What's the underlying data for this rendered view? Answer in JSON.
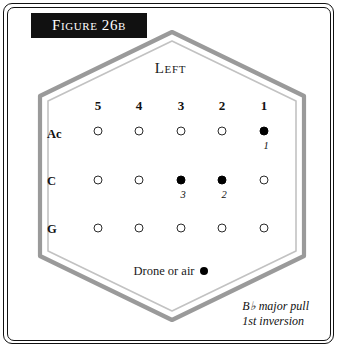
{
  "figure": {
    "title_prefix": "Figure",
    "title_number": "26b",
    "title_full": "Figure 26b"
  },
  "diagram": {
    "orientation_label": "Left",
    "column_headers": [
      "5",
      "4",
      "3",
      "2",
      "1"
    ],
    "row_labels": [
      "Ac",
      "C",
      "G"
    ],
    "rows": [
      {
        "label": "Ac",
        "holes": [
          {
            "column": "5",
            "state": "open",
            "finger": ""
          },
          {
            "column": "4",
            "state": "open",
            "finger": ""
          },
          {
            "column": "3",
            "state": "open",
            "finger": ""
          },
          {
            "column": "2",
            "state": "open",
            "finger": ""
          },
          {
            "column": "1",
            "state": "filled",
            "finger": "1"
          }
        ]
      },
      {
        "label": "C",
        "holes": [
          {
            "column": "5",
            "state": "open",
            "finger": ""
          },
          {
            "column": "4",
            "state": "open",
            "finger": ""
          },
          {
            "column": "3",
            "state": "filled",
            "finger": "3"
          },
          {
            "column": "2",
            "state": "filled",
            "finger": "2"
          },
          {
            "column": "1",
            "state": "open",
            "finger": ""
          }
        ]
      },
      {
        "label": "G",
        "holes": [
          {
            "column": "5",
            "state": "open",
            "finger": ""
          },
          {
            "column": "4",
            "state": "open",
            "finger": ""
          },
          {
            "column": "3",
            "state": "open",
            "finger": ""
          },
          {
            "column": "2",
            "state": "open",
            "finger": ""
          },
          {
            "column": "1",
            "state": "open",
            "finger": ""
          }
        ]
      }
    ],
    "drone_label": "Drone or air",
    "caption_line1": "B♭ major pull",
    "caption_line2": "1st inversion"
  },
  "colors": {
    "frame": "#111111",
    "banner_bg": "#111111",
    "banner_text": "#ffffff",
    "hex_outer": "#9a9a9a",
    "hex_inner": "#bdbdbd",
    "hole_stroke": "#2b2b2b",
    "hole_fill": "#000000",
    "page_bg": "#ffffff"
  }
}
